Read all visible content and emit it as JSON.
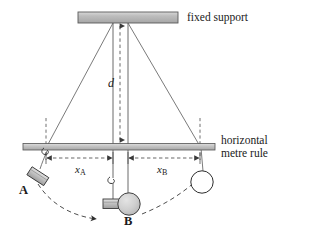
{
  "figure": {
    "type": "physics-diagram",
    "background_color": "#ffffff"
  },
  "labels": {
    "fixed_support": "fixed support",
    "metre_rule_line1": "horizontal",
    "metre_rule_line2": "metre rule",
    "distance_d": "d",
    "distance_xa_symbol": "x",
    "distance_xa_subscript": "A",
    "distance_xb_symbol": "x",
    "distance_xb_subscript": "B",
    "bob_a": "A",
    "bob_b": "B"
  },
  "colors": {
    "bar_fill": "#b3b3b3",
    "bar_fill_light": "#d2d2d2",
    "bar_stroke": "#555555",
    "string": "#6b6b6b",
    "dashed": "#4d4d4d",
    "bob_grey_fill": "#c8c8c8",
    "bob_white_fill": "#ffffff",
    "outline": "#3a3a3a",
    "text": "#1a1a1a"
  },
  "geometry": {
    "fixed_support_bar": {
      "x": 78,
      "y": 12,
      "width": 100,
      "height": 11
    },
    "metre_rule_bar": {
      "x": 23,
      "y": 143,
      "width": 192,
      "height": 7
    },
    "pivot_left": {
      "x": 113,
      "y": 23
    },
    "pivot_right": {
      "x": 128,
      "y": 23
    },
    "rule_anchor_left": {
      "x": 46,
      "y": 147
    },
    "rule_anchor_right": {
      "x": 200,
      "y": 147
    },
    "vertical_guide_left_x": 46,
    "vertical_guide_right_x": 200,
    "d_arrow_x": 120,
    "d_arrow_top_y": 24,
    "d_arrow_bottom_y": 142,
    "measure_arrow_y": 158,
    "bob_a_block": {
      "x": 30,
      "y": 172,
      "width": 17,
      "height": 9,
      "rotation_deg": 32
    },
    "bob_a_hook": {
      "x": 47,
      "y": 151
    },
    "bob_b_circle": {
      "cx": 128,
      "cy": 205,
      "r": 11
    },
    "bob_b_block": {
      "x": 104,
      "y": 199,
      "width": 19,
      "height": 9
    },
    "bob_b_hook": {
      "x": 113,
      "y": 177
    },
    "right_circle": {
      "cx": 201,
      "cy": 182,
      "r": 11
    },
    "swing_arc": {
      "start": {
        "x": 38,
        "y": 185
      },
      "mid": {
        "x": 124,
        "y": 219
      },
      "end": {
        "x": 203,
        "y": 178
      }
    }
  },
  "elements": [
    {
      "name": "fixed-support-bar",
      "kind": "bar"
    },
    {
      "name": "horizontal-metre-rule-bar",
      "kind": "bar"
    },
    {
      "name": "pendulum-string-left-outer",
      "kind": "string"
    },
    {
      "name": "pendulum-string-right-outer",
      "kind": "string"
    },
    {
      "name": "pendulum-string-left-inner",
      "kind": "string"
    },
    {
      "name": "pendulum-string-right-inner",
      "kind": "string"
    },
    {
      "name": "distance-d-dashed-arrow",
      "kind": "dimension"
    },
    {
      "name": "distance-xa-dashed-arrow",
      "kind": "dimension"
    },
    {
      "name": "distance-xb-dashed-arrow",
      "kind": "dimension"
    },
    {
      "name": "vertical-guide-left",
      "kind": "guide"
    },
    {
      "name": "vertical-guide-right",
      "kind": "guide"
    },
    {
      "name": "pendulum-bob-a",
      "kind": "bob"
    },
    {
      "name": "pendulum-bob-b",
      "kind": "bob"
    },
    {
      "name": "pendulum-bob-right",
      "kind": "bob"
    },
    {
      "name": "swing-path-arc",
      "kind": "motion-path"
    }
  ]
}
